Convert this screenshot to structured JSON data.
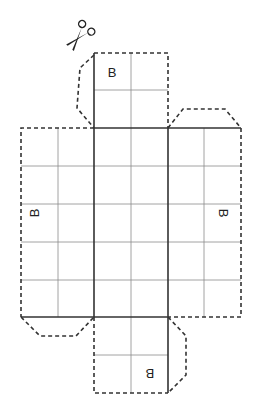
{
  "diagram": {
    "type": "cube-net-cutout",
    "labels": {
      "top_face": "B",
      "left_face": "B",
      "right_face": "B",
      "bottom_face": "B"
    },
    "icons": {
      "scissors": "scissors-icon"
    },
    "colors": {
      "line": "#222222",
      "grid": "#888888",
      "background": "#ffffff"
    }
  }
}
